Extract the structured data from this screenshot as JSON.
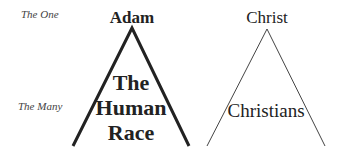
{
  "row_labels": {
    "one": "The One",
    "many": "The Many"
  },
  "left": {
    "title": "Adam",
    "inner_lines": [
      "The",
      "Human",
      "Race"
    ],
    "stroke_color": "#222222",
    "stroke_width": 3
  },
  "right": {
    "title": "Christ",
    "inner": "Christians",
    "stroke_color": "#444444",
    "stroke_width": 1
  }
}
